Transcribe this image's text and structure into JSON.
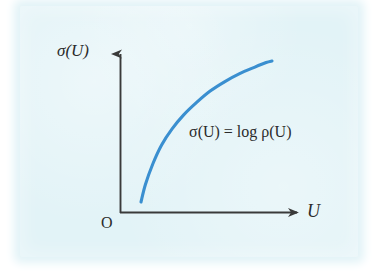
{
  "figure": {
    "panel_background": "#e2f3f7",
    "page_background": "#ffffff",
    "axis_color": "#3a3a3a",
    "curve_color": "#3a8fd0",
    "text_color": "#2b2b2b",
    "origin_label": "O",
    "y_axis_label": "σ(U)",
    "x_axis_label": "U",
    "equation_label": "σ(U) = log ρ(U)"
  },
  "chart_data": {
    "type": "line",
    "title": "",
    "xlabel": "U",
    "ylabel": "σ(U)",
    "legend": [],
    "annotations": [
      {
        "text": "σ(U) = log ρ(U)",
        "x": 189,
        "y": 131
      }
    ],
    "grid": false,
    "axis_arrows": true,
    "origin_marker": "O",
    "xlim": [
      0,
      1
    ],
    "ylim": [
      0,
      1
    ],
    "series": [
      {
        "name": "σ(U) = log ρ(U)",
        "color": "#3a8fd0",
        "x": [
          0.11,
          0.14,
          0.19,
          0.25,
          0.32,
          0.4,
          0.49,
          0.58,
          0.68,
          0.78,
          0.88,
          0.96,
          1.0
        ],
        "y": [
          0.06,
          0.17,
          0.3,
          0.42,
          0.52,
          0.61,
          0.69,
          0.76,
          0.82,
          0.87,
          0.91,
          0.94,
          0.95
        ]
      }
    ]
  }
}
